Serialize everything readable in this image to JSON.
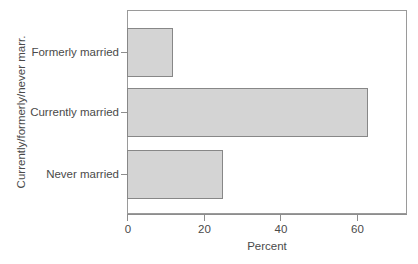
{
  "chart_data": {
    "type": "bar",
    "orientation": "horizontal",
    "title": "",
    "xlabel": "Percent",
    "ylabel": "Currently/formerly/never marr.",
    "categories": [
      "Never married",
      "Currently married",
      "Formerly married"
    ],
    "values": [
      25,
      63,
      12
    ],
    "xlim": [
      0,
      73.2
    ],
    "xticks": [
      0,
      20,
      40,
      60
    ],
    "xticklabels": [
      "0",
      "20",
      "40",
      "60"
    ],
    "grid": false,
    "legend": null,
    "series": [
      {
        "name": "Percent",
        "values": [
          25,
          63,
          12
        ]
      }
    ],
    "bars": [
      {
        "label": "Formerly married",
        "value": 12
      },
      {
        "label": "Currently married",
        "value": 63
      },
      {
        "label": "Never married",
        "value": 25
      }
    ]
  },
  "style": {
    "bar_fill": "#d4d4d4",
    "bar_border": "#878787",
    "axis_color": "#8d8d8d",
    "text_color": "#4a4a4a",
    "background": "#ffffff"
  }
}
